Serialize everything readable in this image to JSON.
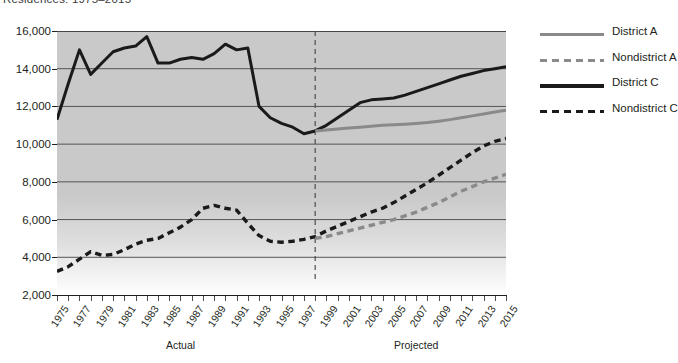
{
  "title": "Residences: 1975–2015",
  "legend": {
    "position": "right",
    "items": [
      {
        "label": "District A",
        "style": "solid-gray",
        "color": "#8a8a8a"
      },
      {
        "label": "Nondistrict A",
        "style": "dash-gray",
        "color": "#8a8a8a"
      },
      {
        "label": "District C",
        "style": "solid-black",
        "color": "#1a1a1a"
      },
      {
        "label": "Nondistrict C",
        "style": "dash-black",
        "color": "#1a1a1a"
      }
    ]
  },
  "axis": {
    "y_ticks": [
      "2,000",
      "4,000",
      "6,000",
      "8,000",
      "10,000",
      "12,000",
      "14,000",
      "16,000"
    ],
    "x_ticks": [
      "1975",
      "1977",
      "1979",
      "1981",
      "1983",
      "1985",
      "1987",
      "1989",
      "1991",
      "1993",
      "1995",
      "1997",
      "1999",
      "2001",
      "2003",
      "2005",
      "2007",
      "2009",
      "2011",
      "2013",
      "2015"
    ],
    "sections": [
      {
        "label": "Actual",
        "center_year": 1986
      },
      {
        "label": "Projected",
        "center_year": 2007
      }
    ]
  },
  "divider": {
    "year": 1998,
    "style": "dashed",
    "color": "#4d4d4d"
  },
  "chart_data": {
    "type": "line",
    "title": "Residences: 1975–2015",
    "xlabel": "",
    "ylabel": "",
    "xlim": [
      1975,
      2015
    ],
    "ylim": [
      2000,
      16000
    ],
    "grid": true,
    "legend_position": "right",
    "x": [
      1975,
      1976,
      1977,
      1978,
      1979,
      1980,
      1981,
      1982,
      1983,
      1984,
      1985,
      1986,
      1987,
      1988,
      1989,
      1990,
      1991,
      1992,
      1993,
      1994,
      1995,
      1996,
      1997,
      1998,
      1999,
      2000,
      2001,
      2002,
      2003,
      2004,
      2005,
      2006,
      2007,
      2008,
      2009,
      2010,
      2011,
      2012,
      2013,
      2014,
      2015
    ],
    "annotations": [
      {
        "text": "Actual",
        "x": 1986,
        "kind": "section-label"
      },
      {
        "text": "Projected",
        "x": 2007,
        "kind": "section-label"
      },
      {
        "text": "forecast divider",
        "x": 1998,
        "kind": "vertical-dashed-line"
      }
    ],
    "series": [
      {
        "name": "District C",
        "style": "solid",
        "color": "#1a1a1a",
        "values": [
          11300,
          13200,
          15000,
          13700,
          14300,
          14900,
          15100,
          15200,
          15700,
          14300,
          14300,
          14500,
          14600,
          14500,
          14800,
          15300,
          15000,
          15100,
          12000,
          11400,
          11100,
          10900,
          10550,
          10700,
          11000,
          11400,
          11800,
          12200,
          12350,
          12400,
          12450,
          12600,
          12800,
          13000,
          13200,
          13400,
          13600,
          13750,
          13900,
          14000,
          14100
        ]
      },
      {
        "name": "District A",
        "style": "solid",
        "color": "#8a8a8a",
        "values": [
          null,
          null,
          null,
          null,
          null,
          null,
          null,
          null,
          null,
          null,
          null,
          null,
          null,
          null,
          null,
          null,
          null,
          null,
          null,
          null,
          null,
          null,
          null,
          10700,
          10750,
          10800,
          10850,
          10900,
          10950,
          11000,
          11030,
          11060,
          11100,
          11150,
          11220,
          11300,
          11400,
          11500,
          11600,
          11700,
          11800
        ]
      },
      {
        "name": "Nondistrict C",
        "style": "dashed",
        "color": "#1a1a1a",
        "values": [
          3250,
          3500,
          3900,
          4300,
          4100,
          4150,
          4400,
          4700,
          4900,
          5000,
          5300,
          5600,
          6000,
          6600,
          6750,
          6600,
          6500,
          5800,
          5150,
          4850,
          4800,
          4850,
          4950,
          5100,
          5400,
          5650,
          5900,
          6150,
          6400,
          6600,
          6900,
          7250,
          7600,
          7950,
          8350,
          8750,
          9150,
          9550,
          9900,
          10150,
          10300
        ]
      },
      {
        "name": "Nondistrict A",
        "style": "dashed",
        "color": "#8a8a8a",
        "values": [
          null,
          null,
          null,
          null,
          null,
          null,
          null,
          null,
          null,
          null,
          null,
          null,
          null,
          null,
          null,
          null,
          null,
          null,
          null,
          null,
          null,
          null,
          null,
          5000,
          5100,
          5250,
          5400,
          5550,
          5700,
          5850,
          6000,
          6200,
          6400,
          6650,
          6900,
          7200,
          7500,
          7750,
          8000,
          8200,
          8400
        ]
      }
    ]
  }
}
